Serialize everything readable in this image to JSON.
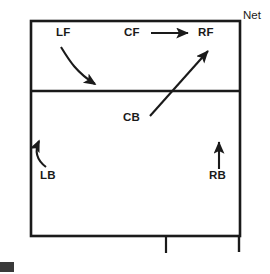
{
  "diagram": {
    "net_label": "Net",
    "court": {
      "outline_color": "#1a1a1a",
      "background_color": "#ffffff",
      "line_width_px": 2.6,
      "left_px": 31,
      "top_px": 21,
      "right_px": 240,
      "bottom_px": 236,
      "service_line_y_px": 91,
      "center_line_stub_x_px": 166,
      "center_line_stub_bottom_px": 253
    },
    "positions": [
      {
        "key": "LF",
        "label": "LF",
        "name": "left-front",
        "x_px": 56,
        "y_px": 26,
        "zone": "front-row",
        "movement": "curved arrow down and to the right toward the service line"
      },
      {
        "key": "CF",
        "label": "CF",
        "name": "center-front",
        "x_px": 124,
        "y_px": 26,
        "zone": "front-row",
        "movement": "straight arrow to the right toward RF"
      },
      {
        "key": "RF",
        "label": "RF",
        "name": "right-front",
        "x_px": 198,
        "y_px": 26,
        "zone": "front-row",
        "movement": "none"
      },
      {
        "key": "CB",
        "label": "CB",
        "name": "center-back",
        "x_px": 123,
        "y_px": 111,
        "zone": "back-row",
        "movement": "straight diagonal arrow up and to the right crossing the service line"
      },
      {
        "key": "LB",
        "label": "LB",
        "name": "left-back",
        "x_px": 40,
        "y_px": 169,
        "zone": "back-row",
        "movement": "short curved arrow up and to the left along the sideline"
      },
      {
        "key": "RB",
        "label": "RB",
        "name": "right-back",
        "x_px": 209,
        "y_px": 169,
        "zone": "back-row",
        "movement": "straight arrow pointing straight up"
      }
    ],
    "arrows": [
      {
        "id": "lf-arrow",
        "from": "LF",
        "type": "curved",
        "start_px": [
          61,
          47
        ],
        "end_px": [
          98,
          87
        ],
        "direction": "down-right",
        "color": "#1a1a1a"
      },
      {
        "id": "cf-arrow",
        "from": "CF",
        "to": "RF",
        "type": "straight",
        "start_px": [
          151,
          33
        ],
        "end_px": [
          191,
          33
        ],
        "direction": "right",
        "color": "#1a1a1a"
      },
      {
        "id": "cb-arrow",
        "from": "CB",
        "type": "straight",
        "start_px": [
          150,
          116
        ],
        "end_px": [
          211,
          48
        ],
        "direction": "up-right",
        "color": "#1a1a1a"
      },
      {
        "id": "lb-arrow",
        "from": "LB",
        "type": "curved",
        "start_px": [
          46,
          167
        ],
        "end_px": [
          38,
          137
        ],
        "direction": "up-left-then-up-right",
        "color": "#1a1a1a"
      },
      {
        "id": "rb-arrow",
        "from": "RB",
        "type": "straight",
        "start_px": [
          219,
          169
        ],
        "end_px": [
          219,
          139
        ],
        "direction": "up",
        "color": "#1a1a1a"
      }
    ],
    "corner_mark_color": "#3a3a3a"
  }
}
